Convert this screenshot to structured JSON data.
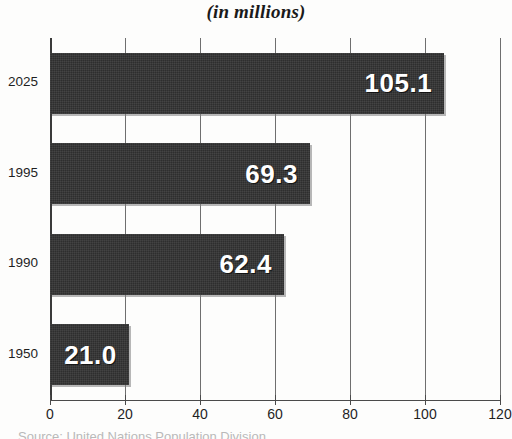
{
  "chart_data": {
    "type": "bar",
    "orientation": "horizontal",
    "title": "(in millions)",
    "subtitle": "",
    "xlabel": "",
    "ylabel": "",
    "categories": [
      "2025",
      "1995",
      "1990",
      "1950"
    ],
    "values": [
      105.1,
      69.3,
      62.4,
      21.0
    ],
    "value_labels": [
      "105.1",
      "69.3",
      "62.4",
      "21.0"
    ],
    "xlim": [
      0,
      120
    ],
    "xticks": [
      0,
      20,
      40,
      60,
      80,
      100,
      120
    ],
    "xtick_labels": [
      "0",
      "20",
      "40",
      "60",
      "80",
      "100",
      "120"
    ],
    "grid": true,
    "grid_axis": "x",
    "legend": false,
    "series": [
      {
        "name": "Population",
        "values": [
          105.1,
          69.3,
          62.4,
          21.0
        ]
      }
    ],
    "bar_color": "#2e2e2e",
    "value_label_color": "#ffffff",
    "background_color": "#fdfdfc",
    "gridline_color": "#6f6f6f"
  },
  "caption": {
    "source": "Source: United Nations Population Division"
  }
}
